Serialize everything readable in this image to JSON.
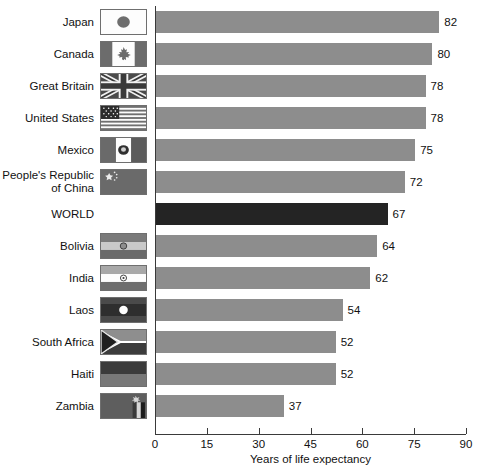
{
  "chart_data": {
    "type": "bar",
    "orientation": "horizontal",
    "title": "",
    "xlabel": "Years of life expectancy",
    "ylabel": "",
    "xlim": [
      0,
      90
    ],
    "xticks": [
      0,
      15,
      30,
      45,
      60,
      75,
      90
    ],
    "grid": false,
    "legend": null,
    "categories": [
      "Japan",
      "Canada",
      "Great Britain",
      "United States",
      "Mexico",
      "People's Republic\nof China",
      "WORLD",
      "Bolivia",
      "India",
      "Laos",
      "South Africa",
      "Haiti",
      "Zambia"
    ],
    "values": [
      82,
      80,
      78,
      78,
      75,
      72,
      67,
      64,
      62,
      54,
      52,
      52,
      37
    ],
    "highlight_category": "WORLD",
    "colors": {
      "bar": "#8d8d8d",
      "highlight_bar": "#242424",
      "axis": "#3a3a3a",
      "text": "#111111",
      "background": "#ffffff"
    }
  },
  "rows": [
    {
      "label": "Japan",
      "value": 82,
      "flag": "flag-japan",
      "has_flag": true,
      "highlight": false
    },
    {
      "label": "Canada",
      "value": 80,
      "flag": "flag-canada",
      "has_flag": true,
      "highlight": false
    },
    {
      "label": "Great Britain",
      "value": 78,
      "flag": "flag-great-britain",
      "has_flag": true,
      "highlight": false
    },
    {
      "label": "United States",
      "value": 78,
      "flag": "flag-united-states",
      "has_flag": true,
      "highlight": false
    },
    {
      "label": "Mexico",
      "value": 75,
      "flag": "flag-mexico",
      "has_flag": true,
      "highlight": false
    },
    {
      "label": "People's Republic\nof China",
      "value": 72,
      "flag": "flag-china",
      "has_flag": true,
      "highlight": false
    },
    {
      "label": "WORLD",
      "value": 67,
      "flag": "",
      "has_flag": false,
      "highlight": true
    },
    {
      "label": "Bolivia",
      "value": 64,
      "flag": "flag-bolivia",
      "has_flag": true,
      "highlight": false
    },
    {
      "label": "India",
      "value": 62,
      "flag": "flag-india",
      "has_flag": true,
      "highlight": false
    },
    {
      "label": "Laos",
      "value": 54,
      "flag": "flag-laos",
      "has_flag": true,
      "highlight": false
    },
    {
      "label": "South Africa",
      "value": 52,
      "flag": "flag-south-africa",
      "has_flag": true,
      "highlight": false
    },
    {
      "label": "Haiti",
      "value": 52,
      "flag": "flag-haiti",
      "has_flag": true,
      "highlight": false
    },
    {
      "label": "Zambia",
      "value": 37,
      "flag": "flag-zambia",
      "has_flag": true,
      "highlight": false
    }
  ],
  "axis": {
    "ticks": [
      "0",
      "15",
      "30",
      "45",
      "60",
      "75",
      "90"
    ],
    "title": "Years of life expectancy"
  }
}
